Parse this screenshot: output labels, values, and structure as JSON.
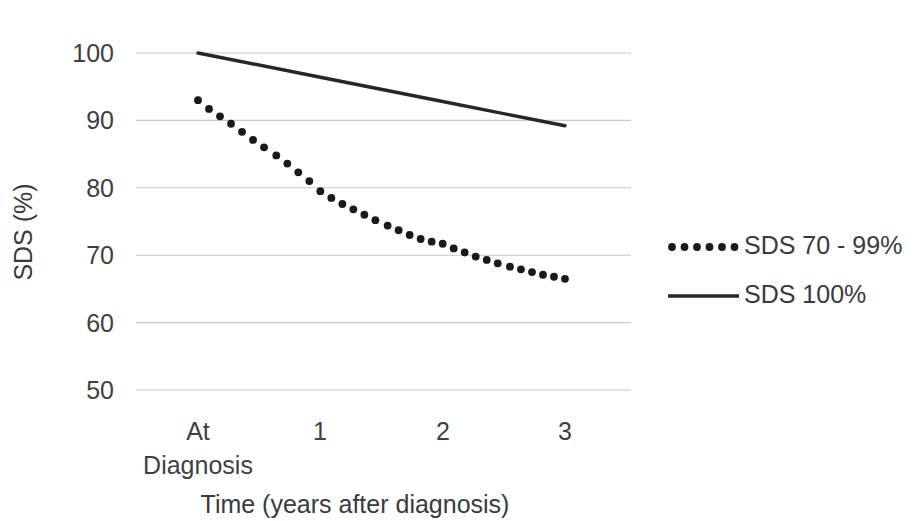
{
  "chart_data": {
    "type": "line",
    "title": "",
    "xlabel": "Time (years after diagnosis)",
    "ylabel": "SDS (%)",
    "x": [
      0,
      1,
      2,
      3
    ],
    "categories": [
      "At Diagnosis",
      "1",
      "2",
      "3"
    ],
    "xtick_labels": [
      "At",
      "1",
      "2",
      "3"
    ],
    "xtick_sublabel": "Diagnosis",
    "ytick_labels": [
      "100",
      "90",
      "80",
      "70",
      "60",
      "50"
    ],
    "ytick_values": [
      100,
      90,
      80,
      70,
      60,
      50
    ],
    "ylim": [
      50,
      100
    ],
    "xlim": [
      0,
      3
    ],
    "grid": true,
    "grid_axis": "y",
    "legend_position": "right",
    "series": [
      {
        "name": "SDS 70 - 99%",
        "style": "dotted",
        "color": "#1a1a1a",
        "values": [
          93.0,
          79.5,
          71.7,
          66.5
        ],
        "points": [
          {
            "x": 0.0,
            "y": 93.0
          },
          {
            "x": 0.09,
            "y": 91.7
          },
          {
            "x": 0.18,
            "y": 90.6
          },
          {
            "x": 0.27,
            "y": 89.5
          },
          {
            "x": 0.36,
            "y": 88.3
          },
          {
            "x": 0.45,
            "y": 87.1
          },
          {
            "x": 0.54,
            "y": 86.0
          },
          {
            "x": 0.64,
            "y": 84.8
          },
          {
            "x": 0.73,
            "y": 83.6
          },
          {
            "x": 0.82,
            "y": 82.3
          },
          {
            "x": 0.91,
            "y": 81.0
          },
          {
            "x": 1.0,
            "y": 79.5
          },
          {
            "x": 1.09,
            "y": 78.5
          },
          {
            "x": 1.18,
            "y": 77.6
          },
          {
            "x": 1.27,
            "y": 76.8
          },
          {
            "x": 1.36,
            "y": 76.0
          },
          {
            "x": 1.45,
            "y": 75.2
          },
          {
            "x": 1.55,
            "y": 74.4
          },
          {
            "x": 1.64,
            "y": 73.7
          },
          {
            "x": 1.73,
            "y": 73.0
          },
          {
            "x": 1.82,
            "y": 72.4
          },
          {
            "x": 1.91,
            "y": 72.0
          },
          {
            "x": 2.0,
            "y": 71.7
          },
          {
            "x": 2.09,
            "y": 71.0
          },
          {
            "x": 2.18,
            "y": 70.4
          },
          {
            "x": 2.27,
            "y": 69.8
          },
          {
            "x": 2.36,
            "y": 69.3
          },
          {
            "x": 2.45,
            "y": 68.8
          },
          {
            "x": 2.55,
            "y": 68.3
          },
          {
            "x": 2.64,
            "y": 67.9
          },
          {
            "x": 2.73,
            "y": 67.5
          },
          {
            "x": 2.82,
            "y": 67.1
          },
          {
            "x": 2.91,
            "y": 66.8
          },
          {
            "x": 3.0,
            "y": 66.5
          }
        ]
      },
      {
        "name": "SDS 100%",
        "style": "solid",
        "color": "#262626",
        "values": [
          100.0,
          96.4,
          92.8,
          89.2
        ],
        "points": [
          {
            "x": 0.0,
            "y": 100.0
          },
          {
            "x": 1.0,
            "y": 96.4
          },
          {
            "x": 2.0,
            "y": 92.8
          },
          {
            "x": 3.0,
            "y": 89.2
          }
        ]
      }
    ],
    "legend": [
      {
        "label": "SDS 70 - 99%",
        "style": "dotted"
      },
      {
        "label": "SDS 100%",
        "style": "solid"
      }
    ]
  }
}
